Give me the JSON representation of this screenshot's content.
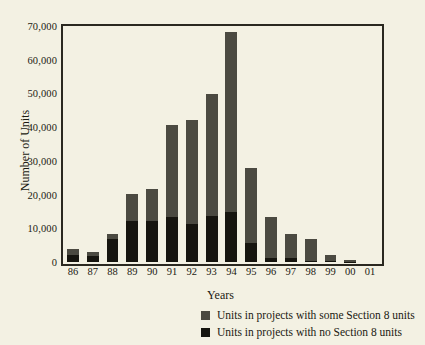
{
  "page": {
    "background_color": "#f3f1e3",
    "top_clipped_text": "",
    "bottom_clipped_text": ""
  },
  "chart_data": {
    "type": "bar",
    "stacked": true,
    "title": "",
    "xlabel": "Years",
    "ylabel": "Number of Units",
    "categories": [
      "86",
      "87",
      "88",
      "89",
      "90",
      "91",
      "92",
      "93",
      "94",
      "95",
      "96",
      "97",
      "98",
      "99",
      "00",
      "01"
    ],
    "series": [
      {
        "name": "Units in projects with no Section 8 units",
        "color": "#16150f",
        "values": [
          2200,
          1700,
          6700,
          12300,
          12300,
          13300,
          11200,
          13700,
          14900,
          5600,
          1100,
          1100,
          300,
          200,
          100,
          0
        ]
      },
      {
        "name": "Units in projects with some Section 8 units",
        "color": "#4b4a41",
        "values": [
          1800,
          1400,
          1700,
          7900,
          9400,
          27200,
          30800,
          36100,
          53400,
          22400,
          12200,
          7100,
          6400,
          1800,
          600,
          0
        ]
      }
    ],
    "totals": [
      4000,
      3100,
      8400,
      20200,
      21700,
      40500,
      42000,
      49800,
      68300,
      28000,
      13300,
      8200,
      6700,
      2000,
      700,
      0
    ],
    "ylim": [
      0,
      70000
    ],
    "ytick_values": [
      0,
      10000,
      20000,
      30000,
      40000,
      50000,
      60000,
      70000
    ],
    "ytick_labels": [
      "0",
      "10,000",
      "20,000",
      "30,000",
      "40,000",
      "50,000",
      "60,000",
      "70,000"
    ],
    "grid": false,
    "legend_position": "below-right",
    "legend": [
      {
        "label": "Units in projects with some Section 8 units",
        "color": "#4b4a41",
        "swatch_name": "legend-swatch-some-section8"
      },
      {
        "label": "Units in projects with no Section 8 units",
        "color": "#16150f",
        "swatch_name": "legend-swatch-no-section8"
      }
    ]
  }
}
